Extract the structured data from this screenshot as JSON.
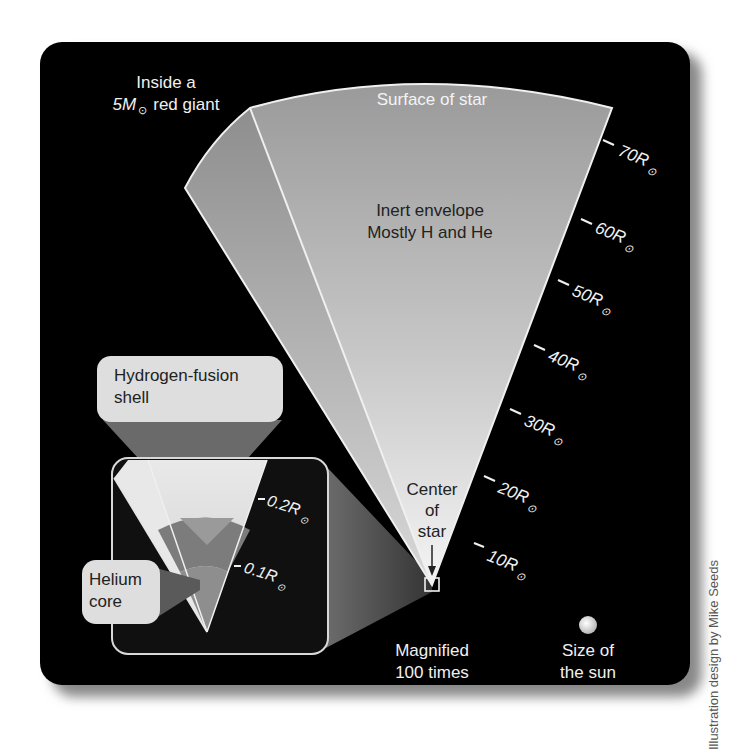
{
  "diagram": {
    "title_line1": "Inside a",
    "title_line2_prefix": "5M",
    "title_line2_suffix": "red giant",
    "sun_symbol": "⊙",
    "surface_label": "Surface of star",
    "envelope_line1": "Inert envelope",
    "envelope_line2": "Mostly H and He",
    "hydrogen_label_line1": "Hydrogen-fusion",
    "hydrogen_label_line2": "shell",
    "helium_label_line1": "Helium",
    "helium_label_line2": "core",
    "center_line1": "Center",
    "center_line2": "of",
    "center_line3": "star",
    "magnified_line1": "Magnified",
    "magnified_line2": "100 times",
    "sun_size_line1": "Size of",
    "sun_size_line2": "the sun",
    "credit": "Illustration design by Mike Seeds",
    "scale_ticks": [
      {
        "value": "10R",
        "unit": "⊙"
      },
      {
        "value": "20R",
        "unit": "⊙"
      },
      {
        "value": "30R",
        "unit": "⊙"
      },
      {
        "value": "40R",
        "unit": "⊙"
      },
      {
        "value": "50R",
        "unit": "⊙"
      },
      {
        "value": "60R",
        "unit": "⊙"
      },
      {
        "value": "70R",
        "unit": "⊙"
      }
    ],
    "inset_ticks": [
      {
        "value": "0.1R",
        "unit": "⊙"
      },
      {
        "value": "0.2R",
        "unit": "⊙"
      }
    ]
  },
  "colors": {
    "background": "#000000",
    "page": "#ffffff",
    "text_light": "#f2f2f2",
    "text_dark": "#222222",
    "envelope_gray": "#a8a8a8",
    "shell_gray": "#6e6e6e",
    "label_bubble": "#dcdcdc"
  }
}
